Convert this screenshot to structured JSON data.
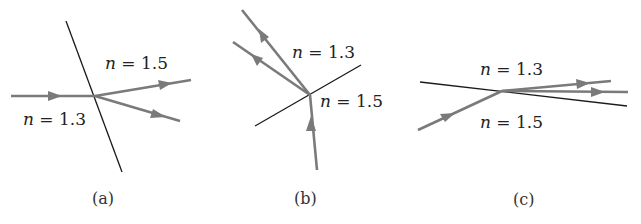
{
  "figure": {
    "panels": [
      {
        "id": "a",
        "caption": "(a)",
        "upper_label_n": "n",
        "upper_label_value": " = 1.5",
        "lower_label_n": "n",
        "lower_label_value": " = 1.3",
        "description": "Ray incident from n = 1.3 onto interface with n = 1.5; two rays emerge into n = 1.5 side"
      },
      {
        "id": "b",
        "caption": "(b)",
        "upper_label_n": "n",
        "upper_label_value": " = 1.3",
        "lower_label_n": "n",
        "lower_label_value": " = 1.5",
        "description": "Ray incident from n = 1.5 below interface; two rays emerge into n = 1.3 side"
      },
      {
        "id": "c",
        "caption": "(c)",
        "upper_label_n": "n",
        "upper_label_value": " = 1.3",
        "lower_label_n": "n",
        "lower_label_value": " = 1.5",
        "description": "Ray incident from n = 1.5 at grazing angle; two rays emerge near the interface"
      }
    ],
    "colors": {
      "interface": "#1a1a1a",
      "ray": "#7a7a7a",
      "background": "#ffffff"
    }
  }
}
